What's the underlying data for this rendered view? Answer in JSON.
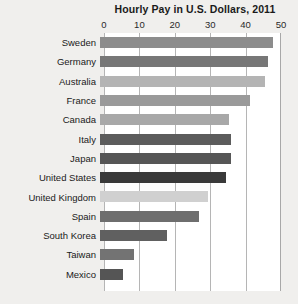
{
  "chart_data": {
    "type": "bar",
    "orientation": "horizontal",
    "title": "Hourly Pay in U.S. Dollars, 2011",
    "xlabel": "",
    "ylabel": "",
    "xlim": [
      0,
      50
    ],
    "xticks": [
      0,
      10,
      20,
      30,
      40,
      50
    ],
    "xtick_labels": [
      "0",
      "10",
      "20",
      "30",
      "40",
      "50"
    ],
    "grid": true,
    "legend": "none",
    "categories": [
      "Sweden",
      "Germany",
      "Australia",
      "France",
      "Canada",
      "Italy",
      "Japan",
      "United States",
      "United Kingdom",
      "Spain",
      "South Korea",
      "Taiwan",
      "Mexico"
    ],
    "values": [
      49,
      47.5,
      46.5,
      42.5,
      36.5,
      37,
      37,
      35.5,
      30.5,
      28,
      19,
      9.5,
      6.5
    ],
    "bar_colors": [
      "#8c8c8c",
      "#777777",
      "#b4b4b4",
      "#9a9a9a",
      "#a8a8a8",
      "#5c5c5c",
      "#565656",
      "#3a3a3a",
      "#d0d0d0",
      "#6e6e6e",
      "#606060",
      "#737373",
      "#555555"
    ],
    "highlight_category": "United States",
    "plot_background": "#ffffff",
    "page_background": "#f0efed",
    "gridline_color": "#b5b5b5",
    "axis_line_color": "#a8a8a8",
    "text_color": "#1a1a1a"
  }
}
